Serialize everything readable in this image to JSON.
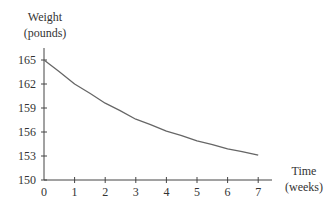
{
  "chart_data": {
    "type": "line",
    "title": "",
    "ylabel": "Weight (pounds)",
    "ylabel_lines": [
      "Weight",
      "(pounds)"
    ],
    "xlabel": "Time (weeks)",
    "xlabel_lines": [
      "Time",
      "(weeks)"
    ],
    "xlim": [
      0,
      7
    ],
    "ylim": [
      150,
      165
    ],
    "x_ticks": [
      0,
      1,
      2,
      3,
      4,
      5,
      6,
      7
    ],
    "y_ticks": [
      150,
      153,
      156,
      159,
      162,
      165
    ],
    "grid": false,
    "legend": null,
    "series": [
      {
        "name": "Weight",
        "x": [
          0,
          1,
          2,
          3,
          4,
          5,
          6,
          7
        ],
        "values": [
          165.0,
          162.0,
          159.6,
          157.6,
          156.1,
          154.9,
          153.9,
          153.1
        ]
      }
    ],
    "line_color": "#666666",
    "axis_color": "#444444"
  }
}
